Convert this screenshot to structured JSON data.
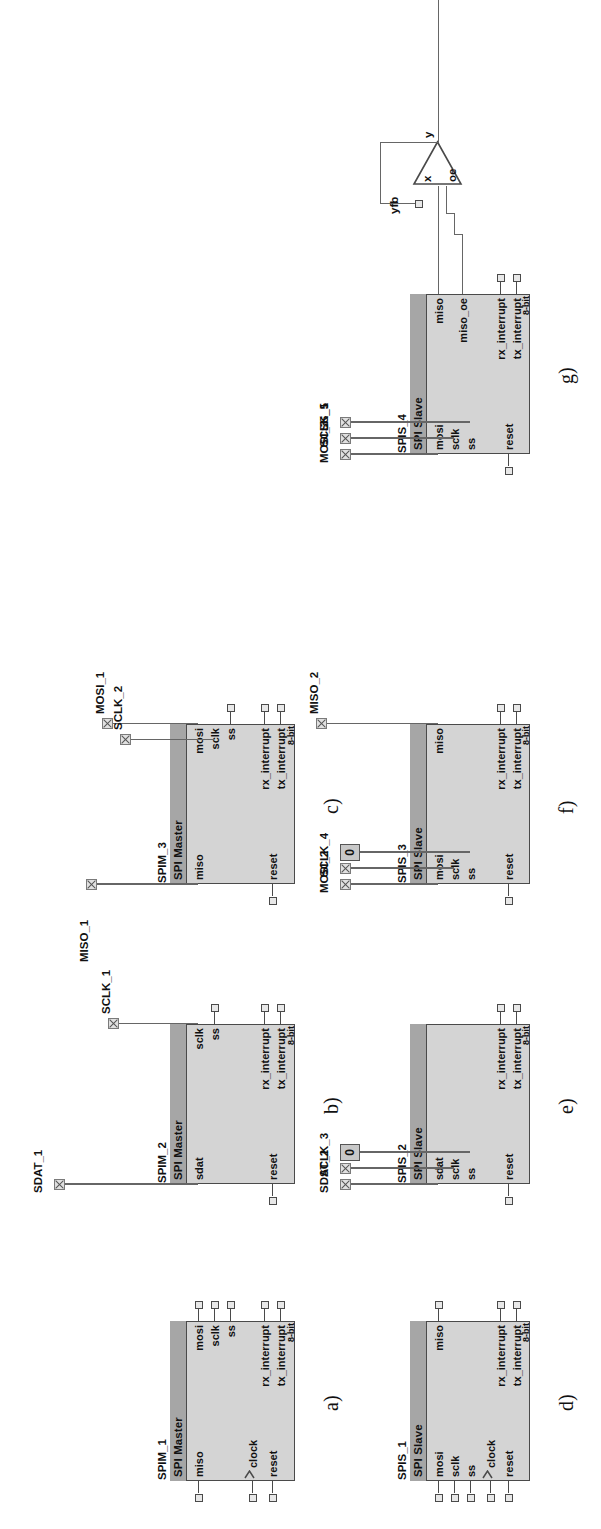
{
  "figure": {
    "orientation": "rotated-90-ccw",
    "bit_width_label": "8-bit",
    "constant_value": "0"
  },
  "panels": [
    {
      "letter": "a)",
      "instance": "SPIM_1",
      "kind": "SPI Master",
      "bits": "8-bit",
      "inputs": [
        "miso",
        "clock",
        "reset"
      ],
      "outputs": [
        "mosi",
        "sclk",
        "ss",
        "rx_interrupt",
        "tx_interrupt"
      ],
      "nets": []
    },
    {
      "letter": "b)",
      "instance": "SPIM_2",
      "kind": "SPI Master",
      "bits": "8-bit",
      "inputs": [
        "sdat",
        "reset"
      ],
      "outputs": [
        "sclk",
        "ss",
        "rx_interrupt",
        "tx_interrupt"
      ],
      "nets": [
        "SDAT_1",
        "SCLK_1"
      ]
    },
    {
      "letter": "c)",
      "instance": "SPIM_3",
      "kind": "SPI Master",
      "bits": "8-bit",
      "inputs": [
        "miso",
        "reset"
      ],
      "outputs": [
        "mosi",
        "sclk",
        "ss",
        "rx_interrupt",
        "tx_interrupt"
      ],
      "nets": [
        "MISO_1",
        "MOSI_1",
        "SCLK_2"
      ]
    },
    {
      "letter": "d)",
      "instance": "SPIS_1",
      "kind": "SPI Slave",
      "bits": "8-bit",
      "inputs": [
        "mosi",
        "sclk",
        "ss",
        "clock",
        "reset"
      ],
      "outputs": [
        "miso",
        "rx_interrupt",
        "tx_interrupt"
      ],
      "nets": []
    },
    {
      "letter": "e)",
      "instance": "SPIS_2",
      "kind": "SPI Slave",
      "bits": "8-bit",
      "inputs": [
        "sdat",
        "sclk",
        "ss",
        "reset"
      ],
      "outputs": [
        "rx_interrupt",
        "tx_interrupt"
      ],
      "nets": [
        "SDAT_2",
        "SCLK_3",
        "0"
      ]
    },
    {
      "letter": "f)",
      "instance": "SPIS_3",
      "kind": "SPI Slave",
      "bits": "8-bit",
      "inputs": [
        "mosi",
        "sclk",
        "ss",
        "reset"
      ],
      "outputs": [
        "miso",
        "rx_interrupt",
        "tx_interrupt"
      ],
      "nets": [
        "MOSI_2",
        "SCLK_4",
        "0",
        "MISO_2"
      ]
    },
    {
      "letter": "g)",
      "instance": "SPIS_4",
      "kind": "SPI Slave",
      "bits": "8-bit",
      "inputs": [
        "mosi",
        "sclk",
        "ss",
        "reset"
      ],
      "outputs": [
        "miso",
        "miso_oe",
        "rx_interrupt",
        "tx_interrupt"
      ],
      "nets": [
        "MOSI_3",
        "SCLK_5",
        "SS_1",
        "MISO_3"
      ],
      "buffer": {
        "type": "tri-state",
        "pins": [
          "x",
          "oe",
          "y",
          "yfb"
        ]
      }
    }
  ],
  "labels": {
    "spi_master": "SPI Master",
    "spi_slave": "SPI Slave",
    "miso": "miso",
    "mosi": "mosi",
    "sclk": "sclk",
    "ss": "ss",
    "sdat": "sdat",
    "clock": "clock",
    "reset": "reset",
    "rx_interrupt": "rx_interrupt",
    "tx_interrupt": "tx_interrupt",
    "miso_oe": "miso_oe",
    "bits": "8-bit",
    "zero": "0",
    "tri_x": "x",
    "tri_oe": "oe",
    "tri_y": "y",
    "tri_yfb": "yfb"
  },
  "colors": {
    "body_fill": "#d4d4d4",
    "title_fill": "#a6a6a6",
    "outline": "#4a4a4a",
    "wire": "#666666",
    "page_bg": "#ffffff"
  }
}
